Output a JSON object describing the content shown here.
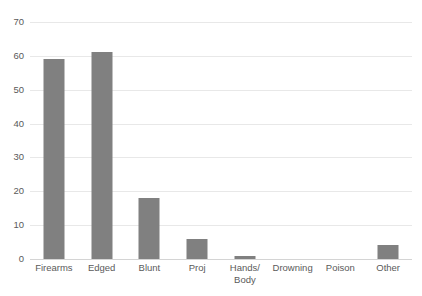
{
  "chart_data": {
    "type": "bar",
    "title": "",
    "subtitle": "",
    "xlabel": "",
    "ylabel": "",
    "categories": [
      "Firearms",
      "Edged",
      "Blunt",
      "Proj",
      "Hands/\nBody",
      "Drowning",
      "Poison",
      "Other"
    ],
    "values": [
      59,
      61,
      18,
      6,
      1,
      0,
      0,
      4
    ],
    "ylim": [
      0,
      70
    ],
    "ytick_labels": [
      "70",
      "60",
      "50",
      "40",
      "30",
      "20",
      "10",
      "0"
    ],
    "ytick_values": [
      70,
      60,
      50,
      40,
      30,
      20,
      10,
      0
    ],
    "grid": true,
    "legend": false,
    "legend_position": "none",
    "bar_color": "#808080",
    "gridline_color": "#e8e8e8",
    "axis_color": "#d4d4d4",
    "text_color": "#5a5a5a"
  }
}
